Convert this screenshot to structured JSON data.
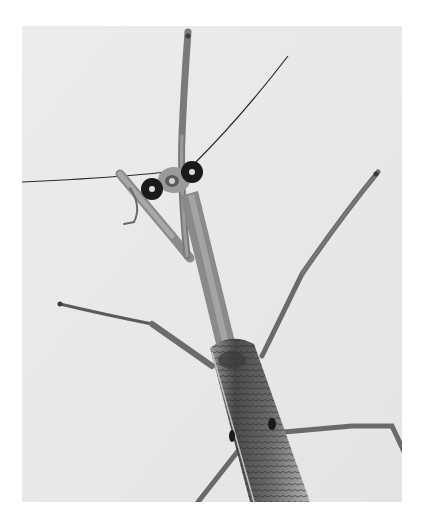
{
  "image": {
    "subject": "praying mantis",
    "description": "Black-and-white photograph of a praying mantis seen from above, wearing a small tag with two dark circular markers on its head, against a pale background",
    "style": "grayscale photograph",
    "colors": {
      "page_background": "#ffffff",
      "photo_background": "#e9e9e9",
      "body_mid": "#8a8a8a",
      "body_dark": "#3a3a3a",
      "marker": "#1a1a1a"
    }
  }
}
